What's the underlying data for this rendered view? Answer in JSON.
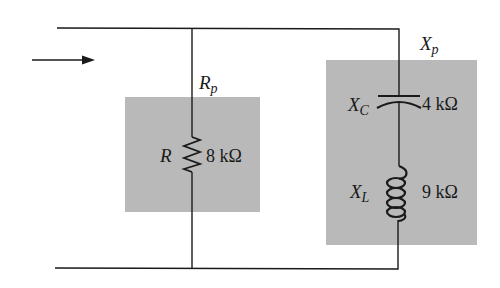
{
  "diagram": {
    "type": "circuit",
    "colors": {
      "wire": "#1a1a1a",
      "shade": "#b9b9b9",
      "background": "#ffffff"
    },
    "current_arrow": {
      "icon": "arrow-right-icon"
    },
    "branches": [
      {
        "id": "resistive",
        "group_label": {
          "main": "R",
          "sub": "p"
        },
        "components": [
          {
            "type": "resistor",
            "name": "R",
            "value": "8 kΩ"
          }
        ]
      },
      {
        "id": "reactive",
        "group_label": {
          "main": "X",
          "sub": "p"
        },
        "components": [
          {
            "type": "capacitor",
            "name": {
              "main": "X",
              "sub": "C"
            },
            "value": "4 kΩ"
          },
          {
            "type": "inductor",
            "name": {
              "main": "X",
              "sub": "L"
            },
            "value": "9 kΩ"
          }
        ]
      }
    ]
  }
}
